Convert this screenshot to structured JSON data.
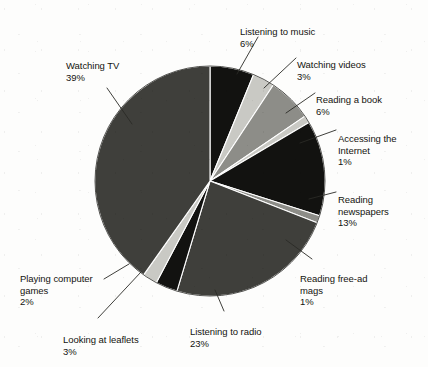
{
  "chart_data": {
    "type": "pie",
    "title": "",
    "subtitle": "",
    "xlabel": "",
    "ylabel": "",
    "legend_position": "none",
    "labels_position": "outside-with-leader-lines",
    "grid": false,
    "units": "%",
    "total": 97,
    "categories": [
      "Listening to music",
      "Watching videos",
      "Reading a book",
      "Accessing the Internet",
      "Reading newspapers",
      "Reading free-ad mags",
      "Listening to radio",
      "Looking at leaflets",
      "Playing computer games",
      "Watching TV"
    ],
    "values": [
      6,
      3,
      6,
      1,
      13,
      1,
      23,
      3,
      2,
      39
    ],
    "slices": [
      {
        "label": "Listening to music",
        "value": 6,
        "pct_text": "6%",
        "color": "#121210",
        "start_deg": 0,
        "end_deg": 21.6
      },
      {
        "label": "Watching videos",
        "value": 3,
        "pct_text": "3%",
        "color": "#c9c9c4",
        "start_deg": 21.6,
        "end_deg": 43.2
      },
      {
        "label": "Reading a book",
        "value": 6,
        "pct_text": "6%",
        "color": "#6e6e69",
        "start_deg": 43.2,
        "end_deg": 64.8
      },
      {
        "label": "Accessing the Internet",
        "value": 1,
        "pct_text": "1%",
        "color": "#121210",
        "start_deg": 64.8,
        "end_deg": 86.4
      },
      {
        "label": "Reading newspapers",
        "value": 13,
        "pct_text": "13%",
        "color": "#8d8d88",
        "start_deg": 86.4,
        "end_deg": 93.6
      },
      {
        "label": "Reading free-ad mags",
        "value": 1,
        "pct_text": "1%",
        "color": "#121210",
        "start_deg": 93.6,
        "end_deg": 140.4
      },
      {
        "label": "Listening to radio",
        "value": 23,
        "pct_text": "23%",
        "color": "#8d8d88",
        "start_deg": 140.4,
        "end_deg": 147.6
      },
      {
        "label": "Looking at leaflets",
        "value": 3,
        "pct_text": "3%",
        "color": "#3f3f3b",
        "start_deg": 147.6,
        "end_deg": 230.4
      },
      {
        "label": "Playing computer games",
        "value": 2,
        "pct_text": "2%",
        "color": "#121210",
        "start_deg": 230.4,
        "end_deg": 241.2
      },
      {
        "label": "Watching TV",
        "value": 39,
        "pct_text": "39%",
        "color": "#3f3f3b",
        "start_deg": 241.2,
        "end_deg": 360
      }
    ],
    "palette": {
      "black": "#121210",
      "light_gray": "#c9c9c4",
      "mid_gray": "#8d8d88",
      "dark_gray": "#3f3f3b",
      "background": "#fdfdfc",
      "text": "#14140f",
      "leader_line": "#2a2a26"
    },
    "geometry": {
      "center_x": 210,
      "center_y": 181,
      "radius": 115
    }
  },
  "labels": {
    "music": {
      "name": "Listening to music",
      "pct": "6%"
    },
    "videos": {
      "name": "Watching videos",
      "pct": "3%"
    },
    "book": {
      "name": "Reading a book",
      "pct": "6%"
    },
    "internet": {
      "name": "Accessing the\nInternet",
      "pct": "1%"
    },
    "news": {
      "name": "Reading\nnewspapers",
      "pct": "13%"
    },
    "freead": {
      "name": "Reading free-ad\nmags",
      "pct": "1%"
    },
    "radio": {
      "name": "Listening to radio",
      "pct": "23%"
    },
    "leaflets": {
      "name": "Looking at leaflets",
      "pct": "3%"
    },
    "games": {
      "name": "Playing computer\ngames",
      "pct": "2%"
    },
    "tv": {
      "name": "Watching TV",
      "pct": "39%"
    }
  }
}
